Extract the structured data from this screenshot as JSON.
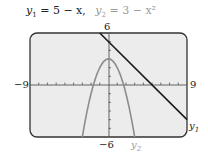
{
  "title": {
    "eq1_var": "y",
    "eq1_sub": "1",
    "eq1_rhs": " = 5 − x,",
    "eq2_var": "y",
    "eq2_sub": "2",
    "eq2_rhs": " = 3 − x²"
  },
  "labels": {
    "ymax": "6",
    "ymin": "−6",
    "xmin": "−9",
    "xmax": "9",
    "y1": "y",
    "y1_sub": "1",
    "y2": "y",
    "y2_sub": "2"
  },
  "colors": {
    "frame": "#333333",
    "background": "#ececec",
    "line_y1": "#1a1a1a",
    "curve_y2": "#8c8c8c",
    "axis": "#555555"
  },
  "chart_data": {
    "type": "line",
    "title": "y1 = 5 − x, y2 = 3 − x²",
    "xlabel": "",
    "ylabel": "",
    "xlim": [
      -9,
      9
    ],
    "ylim": [
      -6,
      6
    ],
    "grid": false,
    "tick_spacing": {
      "x": 1,
      "y": 1
    },
    "legend": "inline labels (y1 at right end of line, y2 below parabola)",
    "series": [
      {
        "name": "y1",
        "expression": "5 - x",
        "style": "dark solid",
        "x": [
          -1,
          0,
          1,
          2,
          3,
          4,
          5,
          6,
          7,
          8,
          9
        ],
        "values": [
          6,
          5,
          4,
          3,
          2,
          1,
          0,
          -1,
          -2,
          -3,
          -4
        ]
      },
      {
        "name": "y2",
        "expression": "3 - x^2",
        "style": "gray solid",
        "x": [
          -3,
          -2,
          -1,
          0,
          1,
          2,
          3
        ],
        "values": [
          -6,
          -1,
          2,
          3,
          2,
          -1,
          -6
        ]
      }
    ]
  }
}
